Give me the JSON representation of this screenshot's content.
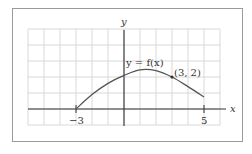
{
  "chart_data": {
    "type": "line",
    "title": "",
    "xlabel": "x",
    "ylabel": "y",
    "xlim": [
      -6,
      6
    ],
    "ylim": [
      -1,
      5
    ],
    "grid": true,
    "grid_spacing": 1,
    "x_tick_labels": [
      "-3",
      "5"
    ],
    "series": [
      {
        "name": "y = f(x)",
        "x": [
          -3,
          -2,
          -1,
          0,
          1,
          2,
          3,
          4,
          5
        ],
        "y": [
          0,
          0.9,
          1.6,
          2.1,
          2.45,
          2.4,
          2.0,
          1.4,
          0.75
        ]
      }
    ],
    "annotations": [
      {
        "text": "y = f(x)",
        "x": 0.2,
        "y": 2.8
      },
      {
        "text": "(3, 2)",
        "x": 3.3,
        "y": 2.2,
        "point": [
          3,
          2
        ]
      }
    ],
    "domain_endpoints": [
      -3,
      5
    ]
  },
  "labels": {
    "x_axis": "x",
    "y_axis": "y",
    "curve": "y = f(x)",
    "point": "(3, 2)",
    "tick_left": "−3",
    "tick_right": "5"
  }
}
